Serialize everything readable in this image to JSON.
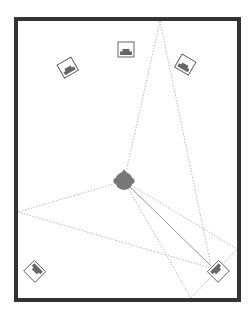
{
  "diagram": {
    "type": "surround-sound room reflection diagram",
    "colors": {
      "background": "#ffffff",
      "wall": "#333333",
      "speaker_box_stroke": "#555555",
      "speaker_fill": "#666666",
      "listener_fill": "#777777",
      "path_line": "#aaaaaa",
      "direct_line": "#888888"
    },
    "room": {
      "x": 16,
      "y": 19,
      "width": 223,
      "height": 281,
      "wall_thickness": 4
    },
    "speakers": [
      {
        "id": "front-left",
        "cx": 68,
        "cy": 68,
        "rotation": -30
      },
      {
        "id": "center",
        "cx": 126,
        "cy": 50,
        "rotation": 0
      },
      {
        "id": "front-right",
        "cx": 185,
        "cy": 65,
        "rotation": 30
      },
      {
        "id": "surround-left",
        "cx": 35,
        "cy": 271,
        "rotation": -135
      },
      {
        "id": "surround-right",
        "cx": 218,
        "cy": 271,
        "rotation": 135
      }
    ],
    "listener": {
      "cx": 124,
      "cy": 181,
      "r": 9
    },
    "reflection_points": [
      {
        "wall": "top",
        "x": 160,
        "y": 21
      },
      {
        "wall": "left",
        "x": 18,
        "y": 212
      },
      {
        "wall": "bottom",
        "x": 191,
        "y": 298
      },
      {
        "wall": "right",
        "x": 237,
        "y": 249
      }
    ],
    "paths": [
      {
        "from": [
          124,
          181
        ],
        "to": [
          160,
          21
        ],
        "style": "dashed"
      },
      {
        "from": [
          160,
          21
        ],
        "to": [
          211,
          266
        ],
        "style": "dashed"
      },
      {
        "from": [
          124,
          181
        ],
        "to": [
          18,
          212
        ],
        "style": "dashed"
      },
      {
        "from": [
          18,
          212
        ],
        "to": [
          211,
          268
        ],
        "style": "dashed"
      },
      {
        "from": [
          124,
          181
        ],
        "to": [
          191,
          298
        ],
        "style": "dashed"
      },
      {
        "from": [
          191,
          298
        ],
        "to": [
          237,
          249
        ],
        "style": "dashed"
      },
      {
        "from": [
          124,
          181
        ],
        "to": [
          237,
          249
        ],
        "style": "dashed"
      },
      {
        "from": [
          124,
          181
        ],
        "to": [
          211,
          266
        ],
        "style": "solid"
      }
    ]
  }
}
